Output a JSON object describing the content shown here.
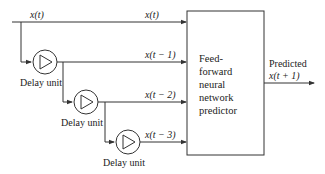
{
  "diagram": {
    "input_label": "x(t)",
    "taps": [
      {
        "label": "x(t)"
      },
      {
        "label": "x(t − 1)"
      },
      {
        "label": "x(t − 2)"
      },
      {
        "label": "x(t − 3)"
      }
    ],
    "delay_units": [
      {
        "label": "Delay unit"
      },
      {
        "label": "Delay unit"
      },
      {
        "label": "Delay unit"
      }
    ],
    "predictor": {
      "lines": [
        "Feed-",
        "forward",
        "neural",
        "network",
        "predictor"
      ]
    },
    "output": {
      "line1": "Predicted",
      "line2": "x(t + 1)"
    },
    "colors": {
      "line": "#333333",
      "background": "#ffffff"
    }
  }
}
